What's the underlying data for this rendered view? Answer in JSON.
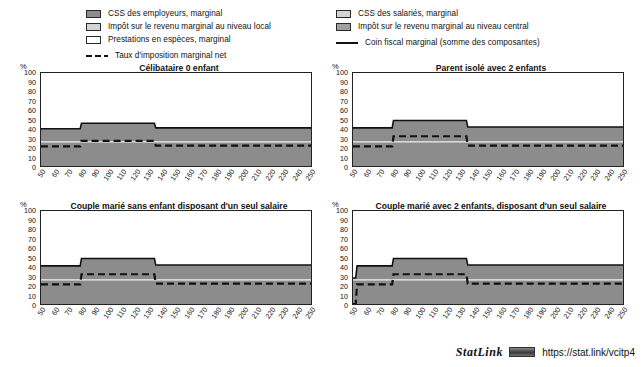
{
  "legend": {
    "left_items": [
      {
        "swatch": "dark-gray-swatch",
        "label": "CSS des employeurs, marginal"
      },
      {
        "swatch": "light-gray-swatch",
        "label": "Impôt sur le revenu marginal au niveau local"
      },
      {
        "swatch": "white-swatch",
        "label": "Prestations en espèces, marginal"
      },
      {
        "swatch": "dashed-line-key",
        "label": "Taux d'imposition marginal net"
      }
    ],
    "right_items": [
      {
        "swatch": "light-gray-swatch",
        "label": "CSS des salariés, marginal"
      },
      {
        "swatch": "mid-gray-swatch",
        "label": "Impôt sur le revenu marginal au niveau central"
      },
      {
        "swatch": "solid-line-key",
        "label": "Coin fiscal marginal (somme des composantes)"
      }
    ]
  },
  "axis": {
    "y_unit": "%",
    "y_ticks": [
      0,
      10,
      20,
      30,
      40,
      50,
      60,
      70,
      80,
      90,
      100
    ],
    "x_ticks": [
      50,
      60,
      70,
      80,
      90,
      100,
      110,
      120,
      130,
      140,
      150,
      160,
      170,
      180,
      190,
      200,
      210,
      220,
      230,
      240,
      250
    ]
  },
  "colors": {
    "band_dark": "#8c8c8c",
    "band_light": "#d3d3d3",
    "band_white": "#ffffff",
    "band_mid": "#a0a0a0",
    "line": "#111111",
    "frame": "#222222"
  },
  "footer": {
    "statlink_word": "StatLink",
    "badge": "statlink-badge-icon",
    "url": "https://stat.link/vcitp4"
  },
  "chart_data": [
    {
      "id": "celibataire-0-enfant",
      "type": "area",
      "title": "Célibataire 0 enfant",
      "xlabel": "",
      "ylabel": "%",
      "xlim": [
        50,
        250
      ],
      "ylim": [
        0,
        100
      ],
      "grid": false,
      "legend_position": "top",
      "x": [
        50,
        79,
        80,
        81,
        133,
        134,
        135,
        250
      ],
      "series": [
        {
          "name": "Coin fiscal marginal (somme des composantes)",
          "style": "solid-line",
          "values": [
            40,
            40,
            46,
            46,
            46,
            46,
            41,
            41
          ]
        },
        {
          "name": "Taux d'imposition marginal net",
          "style": "dashed-line",
          "values": [
            21,
            21,
            27,
            27,
            27,
            27,
            22,
            22
          ]
        },
        {
          "name": "CSS des employeurs, marginal (top of stack)",
          "style": "band-dark-top",
          "values": [
            40,
            40,
            46,
            46,
            46,
            46,
            41,
            41
          ]
        },
        {
          "name": "boundary CSS salariés / light band",
          "style": "band-light-boundary",
          "values": [
            26,
            26,
            26,
            26,
            26,
            26,
            26,
            26
          ]
        }
      ]
    },
    {
      "id": "parent-isole-2-enfants",
      "type": "area",
      "title": "Parent isolé avec 2 enfants",
      "xlabel": "",
      "ylabel": "%",
      "xlim": [
        50,
        250
      ],
      "ylim": [
        0,
        100
      ],
      "grid": false,
      "legend_position": "top",
      "x": [
        50,
        79,
        80,
        81,
        133,
        134,
        135,
        250
      ],
      "series": [
        {
          "name": "Coin fiscal marginal (somme des composantes)",
          "style": "solid-line",
          "values": [
            41,
            41,
            49,
            49,
            49,
            49,
            42,
            42
          ]
        },
        {
          "name": "Taux d'imposition marginal net",
          "style": "dashed-line",
          "values": [
            21,
            21,
            32,
            32,
            32,
            32,
            22,
            22
          ]
        },
        {
          "name": "CSS des employeurs, marginal (top of stack)",
          "style": "band-dark-top",
          "values": [
            41,
            41,
            49,
            49,
            49,
            49,
            42,
            42
          ]
        },
        {
          "name": "boundary CSS salariés / light band",
          "style": "band-light-boundary",
          "values": [
            26,
            26,
            26,
            26,
            26,
            26,
            26,
            26
          ]
        }
      ]
    },
    {
      "id": "couple-marie-sans-enfant",
      "type": "area",
      "title": "Couple marié sans enfant disposant d'un seul salaire",
      "xlabel": "",
      "ylabel": "%",
      "xlim": [
        50,
        250
      ],
      "ylim": [
        0,
        100
      ],
      "grid": false,
      "legend_position": "top",
      "x": [
        50,
        79,
        80,
        81,
        133,
        134,
        135,
        250
      ],
      "series": [
        {
          "name": "Coin fiscal marginal (somme des composantes)",
          "style": "solid-line",
          "values": [
            41,
            41,
            49,
            49,
            49,
            49,
            42,
            42
          ]
        },
        {
          "name": "Taux d'imposition marginal net",
          "style": "dashed-line",
          "values": [
            21,
            21,
            32,
            32,
            32,
            32,
            22,
            22
          ]
        },
        {
          "name": "CSS des employeurs, marginal (top of stack)",
          "style": "band-dark-top",
          "values": [
            41,
            41,
            49,
            49,
            49,
            49,
            42,
            42
          ]
        },
        {
          "name": "boundary CSS salariés / light band",
          "style": "band-light-boundary",
          "values": [
            26,
            26,
            26,
            26,
            26,
            26,
            26,
            26
          ]
        }
      ]
    },
    {
      "id": "couple-marie-2-enfants",
      "type": "area",
      "title": "Couple marié avec 2 enfants, disposant d'un seul salaire",
      "xlabel": "",
      "ylabel": "%",
      "xlim": [
        50,
        250
      ],
      "ylim": [
        0,
        100
      ],
      "grid": false,
      "legend_position": "top",
      "x": [
        50,
        52,
        53,
        79,
        80,
        81,
        133,
        134,
        135,
        250
      ],
      "series": [
        {
          "name": "Coin fiscal marginal (somme des composantes)",
          "style": "solid-line",
          "values": [
            28,
            28,
            41,
            41,
            49,
            49,
            49,
            49,
            42,
            42
          ]
        },
        {
          "name": "Taux d'imposition marginal net",
          "style": "dashed-line",
          "values": [
            0,
            0,
            21,
            21,
            32,
            32,
            32,
            32,
            22,
            22
          ]
        },
        {
          "name": "CSS des employeurs, marginal (top of stack)",
          "style": "band-dark-top",
          "values": [
            28,
            28,
            41,
            41,
            49,
            49,
            49,
            49,
            42,
            42
          ]
        },
        {
          "name": "boundary CSS salariés / light band",
          "style": "band-light-boundary",
          "values": [
            26,
            26,
            26,
            26,
            26,
            26,
            26,
            26,
            26,
            26
          ]
        }
      ]
    }
  ]
}
